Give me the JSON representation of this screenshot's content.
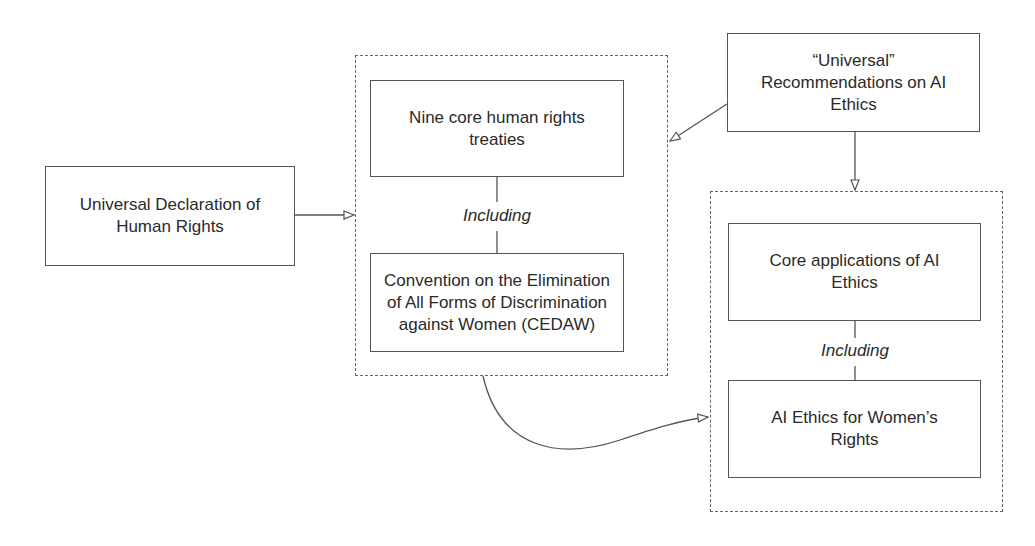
{
  "diagram": {
    "nodes": {
      "udhr": {
        "text": "Universal Declaration of Human Rights"
      },
      "treaties": {
        "text": "Nine core human rights treaties"
      },
      "cedaw": {
        "text": "Convention on the Elimination of All Forms of Discrimination against Women (CEDAW)"
      },
      "ai_recs": {
        "text": "“Universal” Recommendations on AI Ethics"
      },
      "core_apps": {
        "text": "Core applications of AI Ethics"
      },
      "women_ai": {
        "text": "AI Ethics for Women’s Rights"
      }
    },
    "connector_labels": {
      "left_including": "Including",
      "right_including": "Including"
    },
    "edges": [
      {
        "from": "udhr",
        "to": "human-rights-group",
        "style": "open-arrow"
      },
      {
        "from": "ai_recs",
        "to": "human-rights-group",
        "style": "open-arrow"
      },
      {
        "from": "ai_recs",
        "to": "ai-ethics-group",
        "style": "open-arrow"
      },
      {
        "from": "human-rights-group",
        "to": "ai-ethics-group",
        "style": "curved-open-arrow"
      },
      {
        "from": "treaties",
        "to": "cedaw",
        "label": "Including"
      },
      {
        "from": "core_apps",
        "to": "women_ai",
        "label": "Including"
      }
    ]
  }
}
